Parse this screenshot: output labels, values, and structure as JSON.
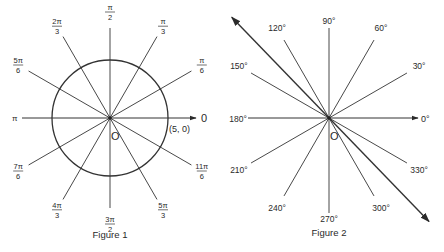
{
  "figure1": {
    "caption": "Figure 1",
    "origin_label": "O",
    "point_label": "(5, 0)",
    "axis_zero_label": "0",
    "pi_label": "π",
    "circle_radius_label": 5,
    "angle_labels": [
      {
        "angle_deg": 30,
        "num": "π",
        "den": "6"
      },
      {
        "angle_deg": 60,
        "num": "π",
        "den": "3"
      },
      {
        "angle_deg": 90,
        "num": "π",
        "den": "2"
      },
      {
        "angle_deg": 120,
        "num": "2π",
        "den": "3"
      },
      {
        "angle_deg": 150,
        "num": "5π",
        "den": "6"
      },
      {
        "angle_deg": 210,
        "num": "7π",
        "den": "6"
      },
      {
        "angle_deg": 240,
        "num": "4π",
        "den": "3"
      },
      {
        "angle_deg": 270,
        "num": "3π",
        "den": "2"
      },
      {
        "angle_deg": 300,
        "num": "5π",
        "den": "3"
      },
      {
        "angle_deg": 330,
        "num": "11π",
        "den": "6"
      }
    ]
  },
  "figure2": {
    "caption": "Figure 2",
    "origin_label": "O",
    "axis_zero_label": "0°",
    "angle_labels": [
      {
        "angle_deg": 30,
        "text": "30°"
      },
      {
        "angle_deg": 60,
        "text": "60°"
      },
      {
        "angle_deg": 90,
        "text": "90°"
      },
      {
        "angle_deg": 120,
        "text": "120°"
      },
      {
        "angle_deg": 150,
        "text": "150°"
      },
      {
        "angle_deg": 180,
        "text": "180°"
      },
      {
        "angle_deg": 210,
        "text": "210°"
      },
      {
        "angle_deg": 240,
        "text": "240°"
      },
      {
        "angle_deg": 270,
        "text": "270°"
      },
      {
        "angle_deg": 300,
        "text": "300°"
      },
      {
        "angle_deg": 330,
        "text": "330°"
      }
    ],
    "double_arrow_angle_deg": 134
  },
  "colors": {
    "ink": "#2a2a2a",
    "background": "#ffffff"
  }
}
